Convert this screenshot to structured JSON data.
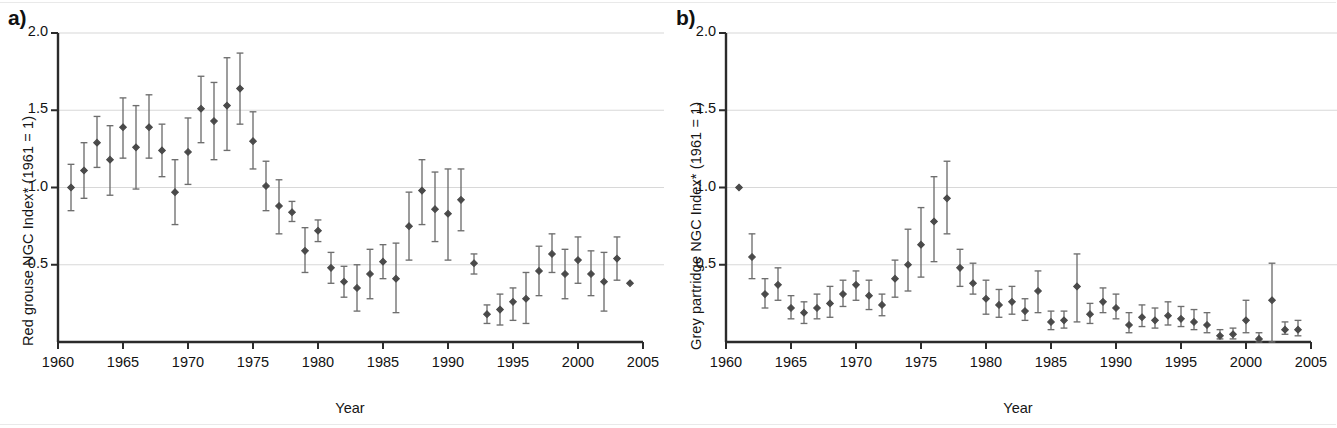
{
  "figure": {
    "background_color": "#ffffff",
    "marker_color": "#4a4a4a",
    "errorbar_color": "#6e6e6e",
    "grid_color": "#d8d8d8",
    "axis_color": "#2b2b2b"
  },
  "panels": [
    {
      "id": "a",
      "label": "a)",
      "xlabel": "Year",
      "ylabel": "Red grouse NGC Index* (1961 = 1)",
      "ytick_labels": [
        "2.0",
        "1.5",
        "1.0",
        "0.5"
      ],
      "xtick_labels": [
        "1960",
        "1965",
        "1970",
        "1975",
        "1980",
        "1985",
        "1990",
        "1995",
        "2000",
        "2005"
      ]
    },
    {
      "id": "b",
      "label": "b)",
      "xlabel": "Year",
      "ylabel": "Grey partridge NGC Index* (1961 = 1)",
      "ytick_labels": [
        "2.0",
        "1.5",
        "1.0",
        "0.5"
      ],
      "xtick_labels": [
        "1960",
        "1965",
        "1970",
        "1975",
        "1980",
        "1985",
        "1990",
        "1995",
        "2000",
        "2005"
      ]
    }
  ],
  "chart_data": [
    {
      "type": "scatter",
      "panel": "a",
      "title": "",
      "xlabel": "Year",
      "ylabel": "Red grouse NGC Index* (1961 = 1)",
      "xlim": [
        1960,
        2005
      ],
      "ylim": [
        0,
        2.0
      ],
      "yticks": [
        0.5,
        1.0,
        1.5,
        2.0
      ],
      "xticks": [
        1960,
        1965,
        1970,
        1975,
        1980,
        1985,
        1990,
        1995,
        2000,
        2005
      ],
      "grid": true,
      "legend": "none",
      "error_bars": "vertical, 95% confidence interval, capped",
      "x": [
        1961,
        1962,
        1963,
        1964,
        1965,
        1966,
        1967,
        1968,
        1969,
        1970,
        1971,
        1972,
        1973,
        1974,
        1975,
        1976,
        1977,
        1978,
        1979,
        1980,
        1981,
        1982,
        1983,
        1984,
        1985,
        1986,
        1987,
        1988,
        1989,
        1990,
        1991,
        1992,
        1993,
        1994,
        1995,
        1996,
        1997,
        1998,
        1999,
        2000,
        2001,
        2002,
        2003,
        2004
      ],
      "y": [
        1.0,
        1.11,
        1.29,
        1.18,
        1.39,
        1.26,
        1.39,
        1.24,
        0.97,
        1.23,
        1.51,
        1.43,
        1.53,
        1.64,
        1.3,
        1.01,
        0.88,
        0.84,
        0.59,
        0.72,
        0.48,
        0.39,
        0.35,
        0.44,
        0.52,
        0.41,
        0.75,
        0.98,
        0.86,
        0.83,
        0.92,
        0.51,
        0.18,
        0.21,
        0.26,
        0.28,
        0.46,
        0.57,
        0.44,
        0.53,
        0.44,
        0.39,
        0.54,
        0.38
      ],
      "y_lower": [
        0.85,
        0.93,
        1.13,
        0.95,
        1.19,
        0.99,
        1.19,
        1.07,
        0.76,
        1.02,
        1.29,
        1.18,
        1.24,
        1.41,
        1.12,
        0.85,
        0.7,
        0.78,
        0.45,
        0.65,
        0.38,
        0.29,
        0.2,
        0.28,
        0.41,
        0.19,
        0.53,
        0.76,
        0.65,
        0.53,
        0.72,
        0.44,
        0.12,
        0.11,
        0.14,
        0.12,
        0.3,
        0.45,
        0.28,
        0.38,
        0.3,
        0.2,
        0.4,
        0.38
      ],
      "y_upper": [
        1.15,
        1.29,
        1.46,
        1.4,
        1.58,
        1.53,
        1.6,
        1.41,
        1.18,
        1.45,
        1.72,
        1.68,
        1.84,
        1.87,
        1.49,
        1.17,
        1.05,
        0.91,
        0.74,
        0.79,
        0.58,
        0.49,
        0.5,
        0.6,
        0.63,
        0.64,
        0.97,
        1.18,
        1.1,
        1.12,
        1.12,
        0.57,
        0.24,
        0.31,
        0.35,
        0.45,
        0.62,
        0.7,
        0.6,
        0.68,
        0.59,
        0.58,
        0.68,
        0.38
      ]
    },
    {
      "type": "scatter",
      "panel": "b",
      "title": "",
      "xlabel": "Year",
      "ylabel": "Grey partridge NGC Index* (1961 = 1)",
      "xlim": [
        1960,
        2005
      ],
      "ylim": [
        0,
        2.0
      ],
      "yticks": [
        0.5,
        1.0,
        1.5,
        2.0
      ],
      "xticks": [
        1960,
        1965,
        1970,
        1975,
        1980,
        1985,
        1990,
        1995,
        2000,
        2005
      ],
      "grid": true,
      "legend": "none",
      "error_bars": "vertical, 95% confidence interval, capped",
      "x": [
        1961,
        1962,
        1963,
        1964,
        1965,
        1966,
        1967,
        1968,
        1969,
        1970,
        1971,
        1972,
        1973,
        1974,
        1975,
        1976,
        1977,
        1978,
        1979,
        1980,
        1981,
        1982,
        1983,
        1984,
        1985,
        1986,
        1987,
        1988,
        1989,
        1990,
        1991,
        1992,
        1993,
        1994,
        1995,
        1996,
        1997,
        1998,
        1999,
        2000,
        2001,
        2002,
        2003,
        2004
      ],
      "y": [
        1.0,
        0.55,
        0.31,
        0.37,
        0.22,
        0.19,
        0.22,
        0.25,
        0.31,
        0.37,
        0.3,
        0.24,
        0.41,
        0.5,
        0.63,
        0.78,
        0.93,
        0.48,
        0.38,
        0.28,
        0.24,
        0.26,
        0.2,
        0.33,
        0.13,
        0.14,
        0.36,
        0.18,
        0.26,
        0.22,
        0.11,
        0.16,
        0.14,
        0.17,
        0.15,
        0.13,
        0.11,
        0.04,
        0.05,
        0.14,
        0.02,
        0.27,
        0.08,
        0.08
      ],
      "y_lower": [
        1.0,
        0.41,
        0.22,
        0.27,
        0.15,
        0.12,
        0.15,
        0.16,
        0.23,
        0.27,
        0.21,
        0.17,
        0.29,
        0.33,
        0.42,
        0.52,
        0.7,
        0.36,
        0.31,
        0.18,
        0.16,
        0.18,
        0.14,
        0.19,
        0.08,
        0.09,
        0.13,
        0.12,
        0.19,
        0.15,
        0.06,
        0.1,
        0.09,
        0.11,
        0.1,
        0.08,
        0.06,
        0.02,
        0.02,
        0.06,
        0.0,
        0.0,
        0.05,
        0.04
      ],
      "y_upper": [
        1.0,
        0.7,
        0.41,
        0.48,
        0.3,
        0.26,
        0.31,
        0.36,
        0.4,
        0.46,
        0.4,
        0.31,
        0.53,
        0.73,
        0.87,
        1.07,
        1.17,
        0.6,
        0.51,
        0.4,
        0.34,
        0.36,
        0.28,
        0.46,
        0.2,
        0.2,
        0.57,
        0.25,
        0.35,
        0.31,
        0.19,
        0.24,
        0.22,
        0.26,
        0.23,
        0.21,
        0.19,
        0.08,
        0.09,
        0.27,
        0.06,
        0.51,
        0.13,
        0.14
      ]
    }
  ]
}
